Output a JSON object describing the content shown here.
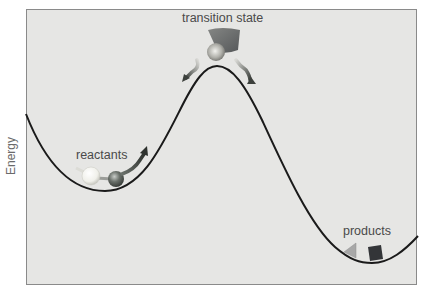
{
  "diagram": {
    "type": "energy-profile",
    "y_axis_label": "Energy",
    "labels": {
      "transition_state": "transition state",
      "reactants": "reactants",
      "products": "products"
    },
    "colors": {
      "background": "#e6e6e4",
      "frame": "#8a8a8a",
      "curve": "#1a1a1a",
      "label_text": "#4a4a4a",
      "reactant_light_ball": "#f4f4f0",
      "reactant_dark_ball": "#5a5f5a",
      "product_triangle": "#a8a8a8",
      "product_square": "#333538",
      "arrow": "#3c403c"
    },
    "curve_points": {
      "start": [
        26,
        114
      ],
      "reactant_min": [
        105,
        191
      ],
      "transition_peak": [
        217,
        66
      ],
      "product_min": [
        370,
        262
      ],
      "end": [
        418,
        235
      ]
    }
  }
}
